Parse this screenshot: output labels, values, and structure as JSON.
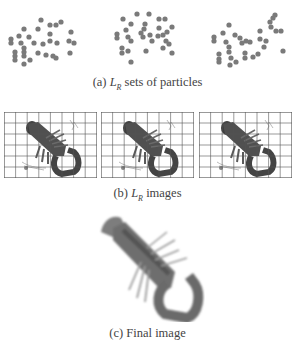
{
  "figure": {
    "subfigures": [
      {
        "id": "a",
        "caption_prefix": "(a) ",
        "caption_symbol": "L",
        "caption_subscript": "R",
        "caption_suffix": " sets of particles",
        "panels": 3,
        "content": "particle scatter"
      },
      {
        "id": "b",
        "caption_prefix": "(b) ",
        "caption_symbol": "L",
        "caption_subscript": "R",
        "caption_suffix": " images",
        "panels": 3,
        "content": "lobster image with grid overlay"
      },
      {
        "id": "c",
        "caption_prefix": "(c) ",
        "caption_text": "Final image",
        "panels": 1,
        "content": "lobster final image"
      }
    ],
    "colors": {
      "particle": "#7a7a7a",
      "grid_line": "#555555",
      "lobster_dark": "#4a4a4a",
      "lobster_mid": "#8a8a8a",
      "caption_text": "#444444"
    },
    "grid": {
      "columns": 8,
      "rows": 6
    }
  }
}
